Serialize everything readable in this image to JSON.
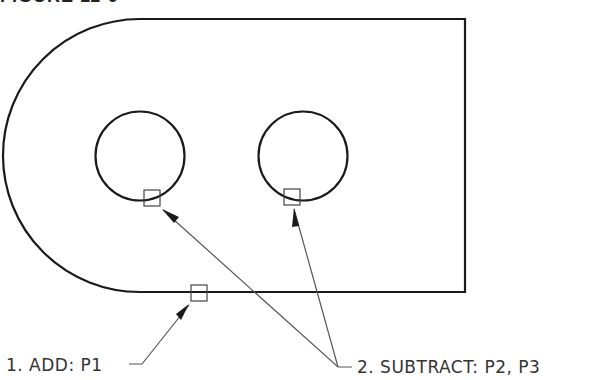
{
  "figure": {
    "title": "FIGURE 11-9"
  },
  "labels": {
    "add": "1. ADD: P1",
    "subtract": "2. SUBTRACT: P2, P3"
  },
  "pick_points": [
    {
      "id": "P1",
      "target": "outer boundary (bottom edge)"
    },
    {
      "id": "P2",
      "target": "left circle"
    },
    {
      "id": "P3",
      "target": "right circle"
    }
  ],
  "colors": {
    "geometry": "#1a1a1a",
    "leader": "#555555",
    "text": "#333333",
    "background": "#ffffff"
  }
}
